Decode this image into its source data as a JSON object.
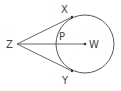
{
  "diagram": {
    "type": "circle-tangents",
    "colors": {
      "stroke": "#555555",
      "text": "#444444",
      "background": "#ffffff"
    },
    "circle": {
      "center_label": "W",
      "cx": 85,
      "cy": 44,
      "r": 29
    },
    "points": {
      "Z": {
        "label": "Z",
        "x": 17,
        "y": 44
      },
      "X": {
        "label": "X",
        "x": 72,
        "y": 18
      },
      "Y": {
        "label": "Y",
        "x": 72,
        "y": 71
      },
      "P": {
        "label": "P",
        "x": 56,
        "y": 44
      },
      "W": {
        "label": "W",
        "x": 85,
        "y": 44
      }
    },
    "segments": [
      {
        "from": "Z",
        "to": "X",
        "kind": "tangent"
      },
      {
        "from": "Z",
        "to": "Y",
        "kind": "tangent"
      },
      {
        "from": "Z",
        "to": "W",
        "kind": "secant-through-P"
      }
    ]
  }
}
